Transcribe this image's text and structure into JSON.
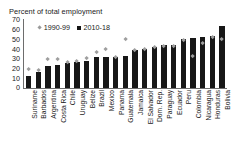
{
  "chart_data": {
    "type": "bar",
    "title": "Percent of total employment",
    "subtitle": "",
    "xlabel": "",
    "ylabel": "",
    "ylim": [
      0,
      70
    ],
    "yticks": [
      70,
      60,
      50,
      40,
      30,
      20,
      10,
      0
    ],
    "grid": false,
    "legend_position": "top-left-inside",
    "categories": [
      "Suriname",
      "Barbados",
      "Argentina",
      "Costa Rica",
      "Chile",
      "Uruguay",
      "Belize",
      "Brazil",
      "Mexico",
      "Panama",
      "Guatemala",
      "Jamaica",
      "El Salvador",
      "Dom. Rep.",
      "Paraguay",
      "Ecuador",
      "Peru",
      "Colombia",
      "Nicaragua",
      "Honduras",
      "Bolivia"
    ],
    "series": [
      {
        "name": "2010-18",
        "marker": "square",
        "color": "#171717",
        "values": [
          12,
          16,
          23,
          24,
          26,
          27,
          28,
          32,
          32,
          32,
          33,
          39,
          40,
          42,
          44,
          44,
          50,
          51,
          53,
          54,
          64
        ]
      },
      {
        "name": "1990-99",
        "marker": "diamond",
        "color": "#9e9e9e",
        "values": [
          19,
          18,
          30,
          30,
          26,
          28,
          31,
          37,
          40,
          32,
          50,
          39,
          40,
          42,
          43,
          43,
          49,
          33,
          46,
          52,
          50
        ]
      }
    ]
  },
  "legend": {
    "items": [
      {
        "label": "1990-99",
        "swatch": "diamond-marker-icon"
      },
      {
        "label": "2010-18",
        "swatch": "square-marker-icon"
      }
    ]
  },
  "colors": {
    "bar": "#171717",
    "marker": "#9e9e9e",
    "axis": "#6d6d6d",
    "text": "#1a1a1a",
    "background": "#ffffff"
  }
}
